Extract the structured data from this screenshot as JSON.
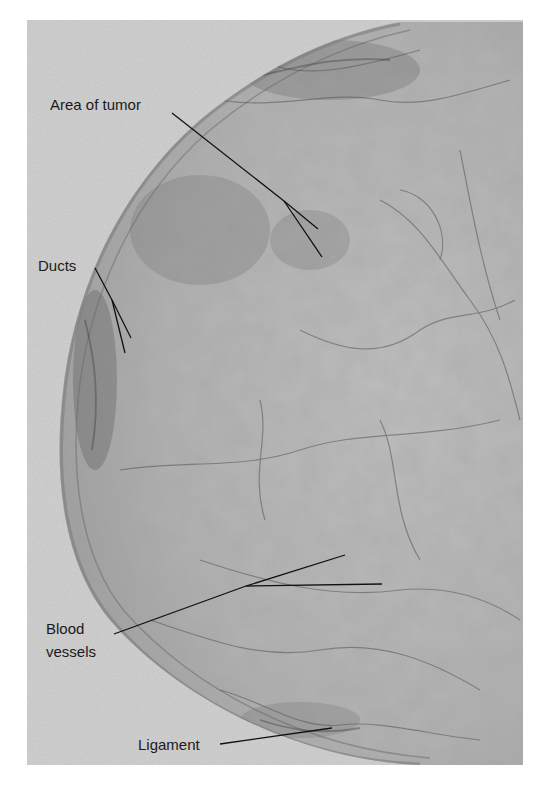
{
  "figure": {
    "type": "annotated mammogram radiograph",
    "colors": {
      "page_background": "#ffffff",
      "film_background": "#d2d2d2",
      "tissue_base": "#a9a9a9",
      "tissue_light": "#c4c4c4",
      "tissue_dark": "#5a5a5a",
      "leader_line": "#111111",
      "label_text": "#1a1a1a"
    },
    "labels": [
      {
        "id": "area-of-tumor",
        "text": "Area of tumor",
        "x": 50,
        "y": 96
      },
      {
        "id": "ducts",
        "text": "Ducts",
        "x": 38,
        "y": 257
      },
      {
        "id": "blood-vessels-line1",
        "text": "Blood",
        "x": 46,
        "y": 620
      },
      {
        "id": "blood-vessels-line2",
        "text": "vessels",
        "x": 46,
        "y": 643
      },
      {
        "id": "ligament",
        "text": "Ligament",
        "x": 138,
        "y": 736
      }
    ]
  }
}
